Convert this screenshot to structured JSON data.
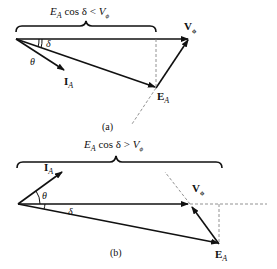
{
  "diagrams": [
    {
      "id": "a",
      "caption": "(a)",
      "brace_label": {
        "E": "E",
        "sub": "A",
        "mid": " cos δ < ",
        "V": "V",
        "vsub": "ϕ"
      },
      "vectors": {
        "V_phi": {
          "label": "V",
          "sub": "ϕ"
        },
        "E_A": {
          "label": "E",
          "sub": "A"
        },
        "I_A": {
          "label": "I",
          "sub": "A"
        }
      },
      "angles": {
        "theta": "θ",
        "delta": "δ"
      }
    },
    {
      "id": "b",
      "caption": "(b)",
      "brace_label": {
        "E": "E",
        "sub": "A",
        "mid": " cos δ > ",
        "V": "V",
        "vsub": "ϕ"
      },
      "vectors": {
        "V_phi": {
          "label": "V",
          "sub": "ϕ"
        },
        "E_A": {
          "label": "E",
          "sub": "A"
        },
        "I_A": {
          "label": "I",
          "sub": "A"
        }
      },
      "angles": {
        "theta": "θ",
        "delta": "δ"
      }
    }
  ]
}
